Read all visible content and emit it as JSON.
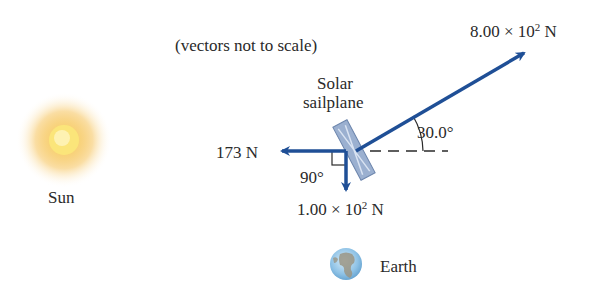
{
  "note": "(vectors not to scale)",
  "sun": {
    "label": "Sun"
  },
  "earth": {
    "label": "Earth"
  },
  "sailplane": {
    "label_line1": "Solar",
    "label_line2": "sailplane"
  },
  "vectors": {
    "upper_right": {
      "mantissa": "8.00 × 10",
      "exp": "2",
      "unit": " N",
      "angle_label": "30.0°"
    },
    "left": {
      "label": "173 N"
    },
    "down": {
      "mantissa": "1.00 × 10",
      "exp": "2",
      "unit": " N",
      "angle_label": "90°"
    }
  },
  "colors": {
    "arrow": "#1f4f96",
    "sail": "#8fa6c8",
    "sun_core": "#fbe57a",
    "sun_glow": "#f6c35a"
  }
}
